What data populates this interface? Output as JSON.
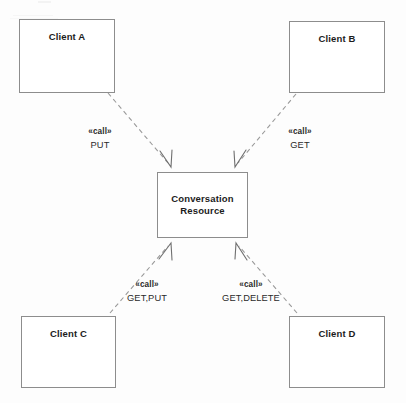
{
  "diagram": {
    "type": "uml-dependency-diagram",
    "background_color": "#fdfdfd",
    "border_color": "#8d8d8d",
    "text_color": "#1c1c1c",
    "nodes": [
      {
        "id": "client-a",
        "label": "Client A",
        "x": 19,
        "y": 19,
        "width": 96,
        "height": 74,
        "label_position": "top"
      },
      {
        "id": "client-b",
        "label": "Client B",
        "x": 289,
        "y": 21,
        "width": 96,
        "height": 72,
        "label_position": "top"
      },
      {
        "id": "conversation-resource",
        "label_line_1": "Conversation",
        "label_line_2": "Resource",
        "x": 157,
        "y": 172,
        "width": 91,
        "height": 66,
        "label_position": "middle"
      },
      {
        "id": "client-c",
        "label": "Client C",
        "x": 21,
        "y": 316,
        "width": 95,
        "height": 72,
        "label_position": "top"
      },
      {
        "id": "client-d",
        "label": "Client D",
        "x": 289,
        "y": 316,
        "width": 96,
        "height": 72,
        "label_position": "top"
      }
    ],
    "edges": [
      {
        "id": "edge-a",
        "from": "client-a",
        "to": "conversation-resource",
        "stereotype": "«call»",
        "methods": "PUT",
        "line_style": "dashed",
        "arrowhead": "open"
      },
      {
        "id": "edge-b",
        "from": "client-b",
        "to": "conversation-resource",
        "stereotype": "«call»",
        "methods": "GET",
        "line_style": "dashed",
        "arrowhead": "open"
      },
      {
        "id": "edge-c",
        "from": "client-c",
        "to": "conversation-resource",
        "stereotype": "«call»",
        "methods": "GET,PUT",
        "line_style": "dashed",
        "arrowhead": "open"
      },
      {
        "id": "edge-d",
        "from": "client-d",
        "to": "conversation-resource",
        "stereotype": "«call»",
        "methods": "GET,DELETE",
        "line_style": "dashed",
        "arrowhead": "open"
      }
    ]
  }
}
